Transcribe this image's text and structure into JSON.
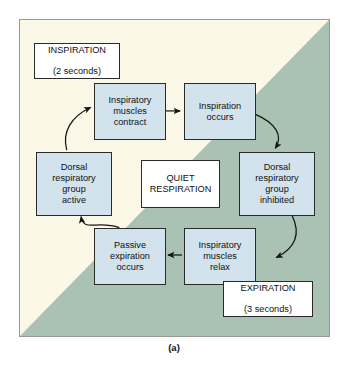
{
  "figure": {
    "caption": "(a)",
    "background": {
      "upper_left_color": "#fbf8e8",
      "lower_right_color": "#a9c2b4",
      "frame_color": "#9a9a93"
    }
  },
  "labels": {
    "inspiration": {
      "title": "INSPIRATION",
      "duration": "(2 seconds)"
    },
    "expiration": {
      "title": "EXPIRATION",
      "duration": "(3 seconds)"
    }
  },
  "center": {
    "title": "QUIET\nRESPIRATION"
  },
  "cycle": {
    "box_fill": "#d3e3ee",
    "box_border": "#2b2b2b",
    "nodes": [
      {
        "id": "inspiratory-muscles-contract",
        "text": "Inspiratory\nmuscles\ncontract"
      },
      {
        "id": "inspiration-occurs",
        "text": "Inspiration\noccurs"
      },
      {
        "id": "dorsal-respiratory-group-inhibited",
        "text": "Dorsal\nrespiratory\ngroup\ninhibited"
      },
      {
        "id": "inspiratory-muscles-relax",
        "text": "Inspiratory\nmuscles\nrelax"
      },
      {
        "id": "passive-expiration-occurs",
        "text": "Passive\nexpiration\noccurs"
      },
      {
        "id": "dorsal-respiratory-group-active",
        "text": "Dorsal\nrespiratory\ngroup\nactive"
      }
    ],
    "edges": [
      {
        "from": "inspiratory-muscles-contract",
        "to": "inspiration-occurs",
        "style": "straight"
      },
      {
        "from": "inspiration-occurs",
        "to": "dorsal-respiratory-group-inhibited",
        "style": "curved"
      },
      {
        "from": "dorsal-respiratory-group-inhibited",
        "to": "inspiratory-muscles-relax",
        "style": "curved"
      },
      {
        "from": "inspiratory-muscles-relax",
        "to": "passive-expiration-occurs",
        "style": "straight"
      },
      {
        "from": "passive-expiration-occurs",
        "to": "dorsal-respiratory-group-active",
        "style": "curved"
      },
      {
        "from": "dorsal-respiratory-group-active",
        "to": "inspiratory-muscles-contract",
        "style": "curved"
      }
    ]
  }
}
